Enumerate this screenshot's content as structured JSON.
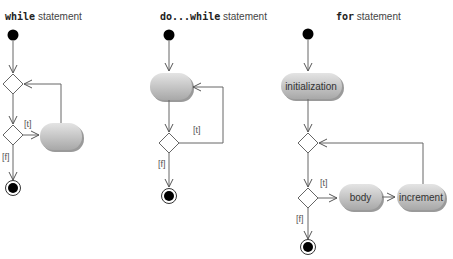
{
  "diagrams": [
    {
      "id": "while",
      "title_keyword": "while",
      "title_rest": " statement",
      "guard_true": "[t]",
      "guard_false": "[f]",
      "actions": [
        ""
      ]
    },
    {
      "id": "do-while",
      "title_keyword": "do...while",
      "title_rest": " statement",
      "guard_true": "[t]",
      "guard_false": "[f]",
      "actions": [
        ""
      ]
    },
    {
      "id": "for",
      "title_keyword": "for",
      "title_rest": " statement",
      "guard_true": "[t]",
      "guard_false": "[f]",
      "actions": [
        "initialization",
        "body",
        "increment"
      ]
    }
  ],
  "colors": {
    "line": "#666666",
    "node_fill": "#000000",
    "action_fill": "#c8c8c8",
    "action_shadow": "#9a9a9a"
  }
}
